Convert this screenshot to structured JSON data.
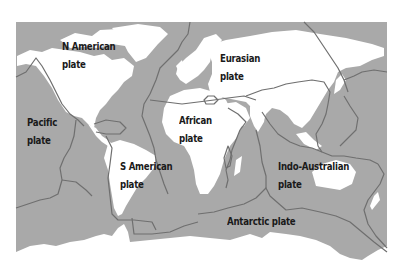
{
  "colors": {
    "ocean": "#a9a9a9",
    "land": "#ffffff",
    "boundary": "#6f6f6f",
    "label": "#1a1a1a",
    "background": "#ffffff"
  },
  "plates": [
    {
      "name": "n-american",
      "line1": "N American",
      "line2": "plate"
    },
    {
      "name": "eurasian",
      "line1": "Eurasian",
      "line2": "plate"
    },
    {
      "name": "pacific",
      "line1": "Pacific",
      "line2": "plate"
    },
    {
      "name": "african",
      "line1": "African",
      "line2": "plate"
    },
    {
      "name": "s-american",
      "line1": "S American",
      "line2": "plate"
    },
    {
      "name": "indo-australian",
      "line1": "Indo-Australian",
      "line2": "plate"
    },
    {
      "name": "antarctic",
      "line1": "Antarctic plate"
    }
  ]
}
